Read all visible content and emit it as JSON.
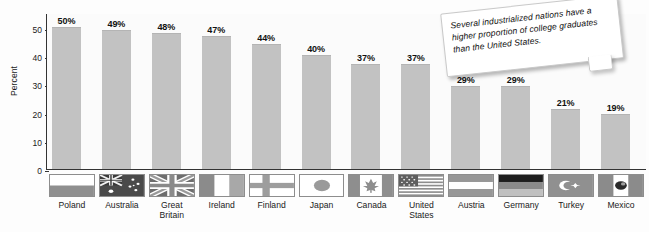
{
  "chart_data": {
    "type": "bar",
    "title": "",
    "subtitle": "",
    "xlabel": "",
    "ylabel": "Percent",
    "ylim": [
      0,
      55
    ],
    "yticks": [
      0,
      10,
      20,
      30,
      40,
      50
    ],
    "grid": false,
    "legend": "none",
    "value_suffix": "%",
    "categories": [
      "Poland",
      "Australia",
      "Great Britain",
      "Ireland",
      "Finland",
      "Japan",
      "Canada",
      "United States",
      "Austria",
      "Germany",
      "Turkey",
      "Mexico"
    ],
    "values": [
      50,
      49,
      48,
      47,
      44,
      40,
      37,
      37,
      29,
      29,
      21,
      19
    ],
    "value_labels": [
      "50%",
      "49%",
      "48%",
      "47%",
      "44%",
      "40%",
      "37%",
      "37%",
      "29%",
      "29%",
      "21%",
      "19%"
    ],
    "bar_color": "#c2c2c2",
    "axis_color": "#333333",
    "annotations": [
      {
        "name": "callout-note",
        "text": "Several industrialized nations have a higher proportion of college graduates than the United States."
      }
    ]
  },
  "axis": {
    "y_title": "Percent",
    "tick_labels": [
      "50",
      "40",
      "30",
      "20",
      "10",
      "0"
    ]
  },
  "countries": [
    {
      "label_line1": "Poland",
      "label_line2": "",
      "flag": "flag-poland"
    },
    {
      "label_line1": "Australia",
      "label_line2": "",
      "flag": "flag-australia"
    },
    {
      "label_line1": "Great",
      "label_line2": "Britain",
      "flag": "flag-great-britain"
    },
    {
      "label_line1": "Ireland",
      "label_line2": "",
      "flag": "flag-ireland"
    },
    {
      "label_line1": "Finland",
      "label_line2": "",
      "flag": "flag-finland"
    },
    {
      "label_line1": "Japan",
      "label_line2": "",
      "flag": "flag-japan"
    },
    {
      "label_line1": "Canada",
      "label_line2": "",
      "flag": "flag-canada"
    },
    {
      "label_line1": "United",
      "label_line2": "States",
      "flag": "flag-united-states"
    },
    {
      "label_line1": "Austria",
      "label_line2": "",
      "flag": "flag-austria"
    },
    {
      "label_line1": "Germany",
      "label_line2": "",
      "flag": "flag-germany"
    },
    {
      "label_line1": "Turkey",
      "label_line2": "",
      "flag": "flag-turkey"
    },
    {
      "label_line1": "Mexico",
      "label_line2": "",
      "flag": "flag-mexico"
    }
  ],
  "callout": {
    "text": "Several industrialized nations have a higher proportion of college graduates than the United States."
  }
}
